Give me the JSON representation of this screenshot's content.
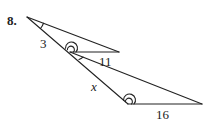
{
  "problem": {
    "number": "8."
  },
  "diagram": {
    "type": "similar-triangles",
    "stroke_color": "#222222",
    "labels": {
      "side_a": "3",
      "side_b": "11",
      "side_x": "x",
      "side_c": "16"
    },
    "vertices": {
      "apex": [
        27,
        17
      ],
      "mid": [
        70,
        52
      ],
      "small_end": [
        119,
        52
      ],
      "bottom_left": [
        128,
        104
      ],
      "bottom_right": [
        202,
        104
      ]
    }
  }
}
